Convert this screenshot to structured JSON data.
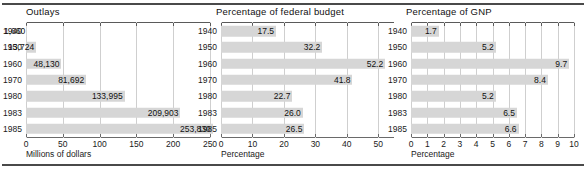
{
  "figure": {
    "panel_count": 3
  },
  "chart_data": [
    {
      "type": "bar",
      "orientation": "horizontal",
      "title": "Outlays",
      "xlabel": "Millions of dollars",
      "ylabel": "",
      "categories": [
        "1940",
        "1950",
        "1960",
        "1970",
        "1980",
        "1983",
        "1985"
      ],
      "values": [
        1660,
        13724,
        48130,
        81692,
        133995,
        209903,
        253830
      ],
      "value_labels": [
        "1,660",
        "13,724",
        "48,130",
        "81,692",
        "133,995",
        "209,903",
        "253,830"
      ],
      "scale_divisor": 1000,
      "xlim": [
        0,
        250
      ],
      "xticks": [
        0,
        50,
        100,
        150,
        200,
        250
      ],
      "xtick_labels": [
        "0",
        "50",
        "100",
        "150",
        "200",
        "250"
      ],
      "grid": "vertical",
      "bar_color": "#d6d6d6",
      "legend": "none"
    },
    {
      "type": "bar",
      "orientation": "horizontal",
      "title": "Percentage of federal budget",
      "xlabel": "Percentage",
      "ylabel": "",
      "categories": [
        "1940",
        "1950",
        "1960",
        "1970",
        "1980",
        "1983",
        "1985"
      ],
      "values": [
        17.5,
        32.2,
        52.2,
        41.8,
        22.7,
        26.0,
        26.5
      ],
      "value_labels": [
        "17.5",
        "32.2",
        "52.2",
        "41.8",
        "22.7",
        "26.0",
        "26.5"
      ],
      "xlim": [
        0,
        55
      ],
      "xticks": [
        0,
        10,
        20,
        30,
        40,
        50
      ],
      "xtick_labels": [
        "0",
        "10",
        "20",
        "30",
        "40",
        "50"
      ],
      "grid": "vertical",
      "bar_color": "#d6d6d6",
      "legend": "none"
    },
    {
      "type": "bar",
      "orientation": "horizontal",
      "title": "Percentage of GNP",
      "xlabel": "Percentage",
      "ylabel": "",
      "categories": [
        "1940",
        "1950",
        "1960",
        "1970",
        "1980",
        "1983",
        "1985"
      ],
      "values": [
        1.7,
        5.2,
        9.7,
        8.4,
        5.2,
        6.5,
        6.6
      ],
      "value_labels": [
        "1.7",
        "5.2",
        "9.7",
        "8.4",
        "5.2",
        "6.5",
        "6.6"
      ],
      "xlim": [
        0,
        10
      ],
      "xticks": [
        0,
        1,
        2,
        3,
        4,
        5,
        6,
        7,
        8,
        9,
        10
      ],
      "xtick_labels": [
        "0",
        "1",
        "2",
        "3",
        "4",
        "5",
        "6",
        "7",
        "8",
        "9",
        "10"
      ],
      "grid": "vertical",
      "bar_color": "#d6d6d6",
      "legend": "none"
    }
  ]
}
